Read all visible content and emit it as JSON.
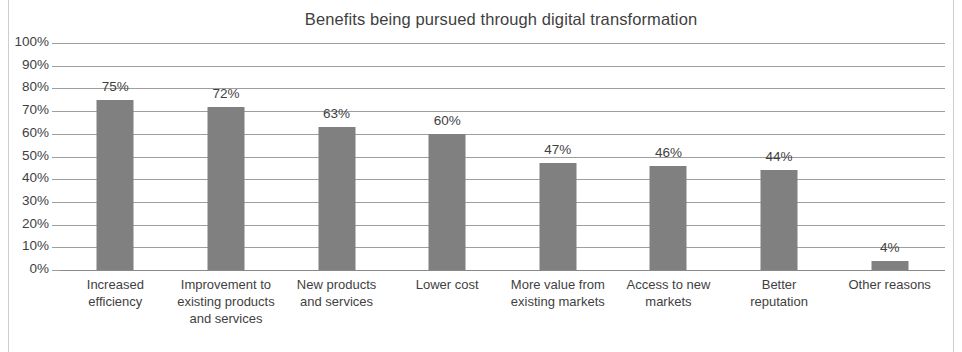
{
  "chart_data": {
    "type": "bar",
    "title": "Benefits being pursued through digital transformation",
    "xlabel": "",
    "ylabel": "",
    "ylim": [
      0,
      100
    ],
    "grid": true,
    "legend": "none",
    "orientation": "vertical",
    "value_suffix": "%",
    "categories": [
      "Increased efficiency",
      "Improvement to existing products and services",
      "New products and services",
      "Lower cost",
      "More value from existing markets",
      "Access to new markets",
      "Better reputation",
      "Other reasons"
    ],
    "values": [
      75,
      72,
      63,
      60,
      47,
      46,
      44,
      4
    ],
    "data_labels": [
      "75%",
      "72%",
      "63%",
      "60%",
      "47%",
      "46%",
      "44%",
      "4%"
    ],
    "ytick_labels": [
      "100%",
      "90%",
      "80%",
      "70%",
      "60%",
      "50%",
      "40%",
      "30%",
      "20%",
      "10%",
      "0%"
    ],
    "ytick_values": [
      100,
      90,
      80,
      70,
      60,
      50,
      40,
      30,
      20,
      10,
      0
    ],
    "colors": {
      "bar": "#808080",
      "gridline": "#9e9e9e",
      "text": "#3f3f3f",
      "background": "#ffffff",
      "frame": "#cdcdcd"
    }
  },
  "axis": {
    "category_lines": [
      [
        "Increased",
        "efficiency"
      ],
      [
        "Improvement to",
        "existing products",
        "and services"
      ],
      [
        "New products",
        "and services"
      ],
      [
        "Lower cost"
      ],
      [
        "More value from",
        "existing markets"
      ],
      [
        "Access to new",
        "markets"
      ],
      [
        "Better",
        "reputation"
      ],
      [
        "Other reasons"
      ]
    ]
  }
}
